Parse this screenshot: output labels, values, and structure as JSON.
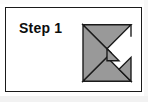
{
  "panel": {
    "step_label": "Step 1",
    "border_color": "#1a1a1a",
    "background_color": "#ffffff"
  },
  "figure": {
    "name": "tangram-square-with-notch",
    "fill_color": "#999999",
    "outline_color": "#1a1a1a",
    "white_color": "#ffffff",
    "pieces": [
      {
        "name": "large-triangle-left",
        "points": "6,9 6,75 39,42"
      },
      {
        "name": "large-triangle-bottom",
        "points": "6,75 62,75 34,47"
      },
      {
        "name": "medium-triangle-top",
        "points": "6,9 62,9 34,37"
      },
      {
        "name": "small-triangle-right-lower",
        "points": "62,75 62,47 48,61"
      },
      {
        "name": "small-triangle-notch-inner",
        "points": "34,37 48,51 34,51"
      }
    ],
    "square_bounds": {
      "left": 6,
      "top": 9,
      "right": 62,
      "bottom": 75
    }
  }
}
